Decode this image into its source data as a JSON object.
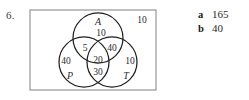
{
  "question": {
    "number": "6."
  },
  "figure": {
    "type": "venn-3-set",
    "universal_outside_label": "10",
    "sets": [
      {
        "id": "A",
        "label": "A",
        "position": "top"
      },
      {
        "id": "P",
        "label": "P",
        "position": "bottom-left"
      },
      {
        "id": "T",
        "label": "T",
        "position": "bottom-right"
      }
    ],
    "regions": [
      {
        "id": "A-only",
        "label": "10",
        "description": "A only"
      },
      {
        "id": "P-only",
        "label": "40",
        "description": "P only"
      },
      {
        "id": "T-only",
        "label": "10",
        "description": "T only"
      },
      {
        "id": "A-and-P",
        "label": "5",
        "description": "A intersect P only"
      },
      {
        "id": "A-and-T",
        "label": "40",
        "description": "A intersect T only"
      },
      {
        "id": "P-and-T",
        "label": "30",
        "description": "P intersect T only"
      },
      {
        "id": "A-P-T",
        "label": "20",
        "description": "A intersect P intersect T"
      },
      {
        "id": "outside",
        "label": "10",
        "description": "outside all three sets"
      }
    ]
  },
  "answers": [
    {
      "key": "a",
      "value": "165"
    },
    {
      "key": "b",
      "value": "40"
    }
  ],
  "colors": {
    "ink": "#2b2b2b",
    "rule": "#8c8c8c",
    "circle": "#1f1f1f",
    "page": "#ffffff"
  }
}
